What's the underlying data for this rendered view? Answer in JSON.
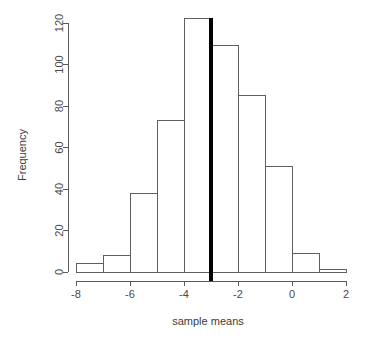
{
  "chart_data": {
    "type": "bar",
    "title": "",
    "subtitle": "",
    "xlabel": "sample means",
    "ylabel": "Frequency",
    "xlim": [
      -8,
      2
    ],
    "ylim": [
      0,
      120
    ],
    "grid": false,
    "legend": null,
    "bin_width": 1,
    "bin_edges": [
      -8,
      -7,
      -6,
      -5,
      -4,
      -3,
      -2,
      -1,
      0,
      1,
      2
    ],
    "categories": [
      "-8 to -7",
      "-7 to -6",
      "-6 to -5",
      "-5 to -4",
      "-4 to -3",
      "-3 to -2",
      "-2 to -1",
      "-1 to 0",
      "0 to 1",
      "1 to 2"
    ],
    "values": [
      4,
      8,
      38,
      73,
      122,
      109,
      85,
      51,
      9,
      1
    ],
    "xticks": [
      -8,
      -6,
      -4,
      -2,
      0,
      2
    ],
    "xtick_labels": [
      "-8",
      "-6",
      "-4",
      "-2",
      "0",
      "2"
    ],
    "yticks": [
      0,
      20,
      40,
      60,
      80,
      100,
      120
    ],
    "ytick_labels": [
      "0",
      "20",
      "40",
      "60",
      "80",
      "100",
      "120"
    ],
    "annotations": [
      {
        "name": "reference-line",
        "type": "vline",
        "x": -3,
        "color": "#000000",
        "linewidth": 4
      }
    ],
    "colors": {
      "bar_fill": "#ffffff",
      "bar_stroke": "#5f5f5f",
      "axis": "#5a5a5a",
      "text": "#3c3c3c",
      "reference_line": "#000000"
    }
  }
}
